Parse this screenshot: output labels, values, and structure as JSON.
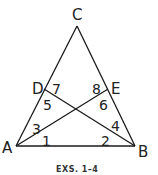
{
  "figure": {
    "caption": "EXS. 1–4",
    "stroke_color": "#1a1a1a",
    "points": {
      "A": {
        "label": "A",
        "x": 16,
        "y": 146
      },
      "B": {
        "label": "B",
        "x": 135,
        "y": 146
      },
      "C": {
        "label": "C",
        "x": 77,
        "y": 26
      },
      "D": {
        "label": "D",
        "x": 44,
        "y": 89
      },
      "E": {
        "label": "E",
        "x": 108,
        "y": 89
      }
    },
    "segments": [
      "AC",
      "BC",
      "AB",
      "AE",
      "BD"
    ],
    "angle_labels": [
      {
        "label": "1",
        "x": 42,
        "y": 142
      },
      {
        "label": "2",
        "x": 101,
        "y": 142
      },
      {
        "label": "3",
        "x": 33,
        "y": 130
      },
      {
        "label": "4",
        "x": 112,
        "y": 128
      },
      {
        "label": "5",
        "x": 44,
        "y": 108
      },
      {
        "label": "6",
        "x": 100,
        "y": 108
      },
      {
        "label": "7",
        "x": 53,
        "y": 93
      },
      {
        "label": "8",
        "x": 91,
        "y": 93
      }
    ]
  }
}
